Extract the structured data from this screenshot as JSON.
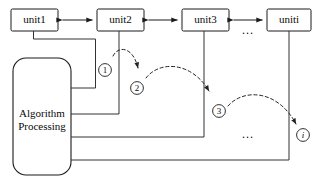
{
  "diagram": {
    "units": [
      {
        "id": "unit1",
        "label": "unit1"
      },
      {
        "id": "unit2",
        "label": "unit2"
      },
      {
        "id": "unit3",
        "label": "unit3"
      },
      {
        "id": "uniti",
        "label": "uniti"
      }
    ],
    "processor": {
      "line1": "Algorithm",
      "line2": "Processing"
    },
    "steps": [
      {
        "id": "step-1",
        "label": "①",
        "text": "1"
      },
      {
        "id": "step-2",
        "label": "②",
        "text": "2"
      },
      {
        "id": "step-3",
        "label": "③",
        "text": "3"
      },
      {
        "id": "step-i",
        "label": "i",
        "text": "i"
      }
    ],
    "ellipses": [
      {
        "id": "ellipsis-top",
        "text": "..."
      },
      {
        "id": "ellipsis-middle",
        "text": "..."
      }
    ],
    "colors": {
      "stroke": "#1a1a1a",
      "wire": "#333333",
      "background": "#ffffff"
    }
  }
}
